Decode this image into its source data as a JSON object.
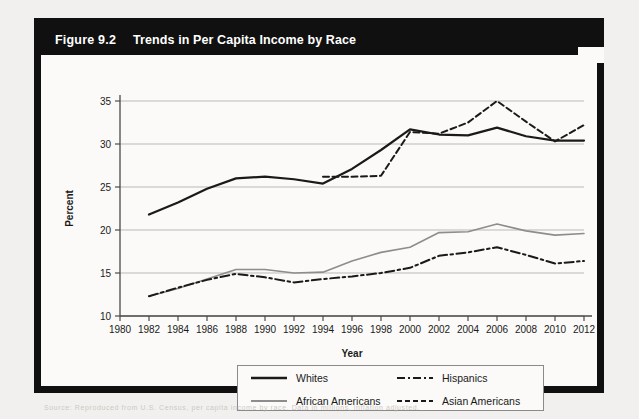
{
  "figure": {
    "number": "Figure 9.2",
    "title": "Trends in Per Capita Income by Race",
    "footer_note": "Source: Reproduced from U.S. Census, per capita income by race. Data in millions, inflation adjusted."
  },
  "legend": {
    "items": [
      {
        "label": "Whites",
        "key": "solid-thick-black",
        "color": "#1a1a1a"
      },
      {
        "label": "African Americans",
        "key": "solid-gray",
        "color": "#8d8d8d"
      },
      {
        "label": "Hispanics",
        "key": "dash-dot-black",
        "color": "#1a1a1a"
      },
      {
        "label": "Asian Americans",
        "key": "dashed-black",
        "color": "#1a1a1a"
      }
    ]
  },
  "chart_data": {
    "type": "line",
    "title": "Trends in Per Capita Income by Race",
    "xlabel": "Year",
    "ylabel": "Percent",
    "xlim": [
      1980,
      2012
    ],
    "ylim": [
      10,
      35
    ],
    "xticks": [
      1980,
      1982,
      1984,
      1986,
      1988,
      1990,
      1992,
      1994,
      1996,
      1998,
      2000,
      2002,
      2004,
      2006,
      2008,
      2010,
      2012
    ],
    "yticks": [
      10,
      15,
      20,
      25,
      30,
      35
    ],
    "grid": "horizontal",
    "legend_position": "bottom",
    "series": [
      {
        "name": "Whites",
        "style": "solid",
        "color": "#1a1a1a",
        "width": 2.2,
        "x": [
          1982,
          1984,
          1986,
          1988,
          1990,
          1992,
          1994,
          1996,
          1998,
          2000,
          2002,
          2004,
          2006,
          2008,
          2010,
          2012
        ],
        "values": [
          21.8,
          23.2,
          24.8,
          26.0,
          26.2,
          25.9,
          25.4,
          27.1,
          29.3,
          31.7,
          31.1,
          31.0,
          31.9,
          30.9,
          30.4,
          30.4
        ]
      },
      {
        "name": "African Americans",
        "style": "solid",
        "color": "#8d8d8d",
        "width": 1.6,
        "x": [
          1982,
          1984,
          1986,
          1988,
          1990,
          1992,
          1994,
          1996,
          1998,
          2000,
          2002,
          2004,
          2006,
          2008,
          2010,
          2012
        ],
        "values": [
          12.3,
          13.2,
          14.3,
          15.4,
          15.4,
          15.0,
          15.1,
          16.4,
          17.4,
          18.0,
          19.7,
          19.8,
          20.7,
          19.9,
          19.4,
          19.6
        ]
      },
      {
        "name": "Hispanics",
        "style": "dash-dot",
        "color": "#1a1a1a",
        "width": 2.0,
        "x": [
          1982,
          1984,
          1986,
          1988,
          1990,
          1992,
          1994,
          1996,
          1998,
          2000,
          2002,
          2004,
          2006,
          2008,
          2010,
          2012
        ],
        "values": [
          12.3,
          13.3,
          14.2,
          14.9,
          14.5,
          13.9,
          14.3,
          14.6,
          15.0,
          15.6,
          17.0,
          17.4,
          18.0,
          17.1,
          16.1,
          16.4
        ]
      },
      {
        "name": "Asian Americans",
        "style": "dashed",
        "color": "#1a1a1a",
        "width": 2.0,
        "x": [
          1994,
          1996,
          1998,
          2000,
          2002,
          2004,
          2006,
          2008,
          2010,
          2012
        ],
        "values": [
          26.2,
          26.2,
          26.3,
          31.4,
          31.2,
          32.5,
          35.0,
          32.6,
          30.3,
          32.2
        ]
      }
    ]
  }
}
